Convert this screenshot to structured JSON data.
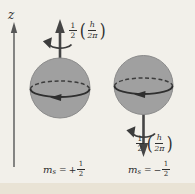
{
  "figure": {
    "type": "physics-diagram",
    "colors": {
      "background": "#f2f0ea",
      "bottom_strip": "#e9e3d5",
      "sphere_fill": "#a0a0a0",
      "sphere_edge": "#8a8a8a",
      "line": "#3c3c3c",
      "axis": "#565656",
      "text": "#2e2e2e"
    },
    "z_axis": {
      "label": "z"
    },
    "spin_up": {
      "magnitude": {
        "coeff_num": "1",
        "coeff_den": "2",
        "lparen": "(",
        "inner_num": "h",
        "inner_den": "2π",
        "rparen": ")"
      },
      "quantum_number": {
        "symbol": "m",
        "sub": "s",
        "eq": "=",
        "sign": "+",
        "num": "1",
        "den": "2"
      }
    },
    "spin_down": {
      "magnitude": {
        "coeff_num": "1",
        "coeff_den": "2",
        "lparen": "(",
        "inner_num": "h",
        "inner_den": "2π",
        "rparen": ")"
      },
      "quantum_number": {
        "symbol": "m",
        "sub": "s",
        "eq": "=",
        "sign": "−",
        "num": "1",
        "den": "2"
      }
    }
  }
}
